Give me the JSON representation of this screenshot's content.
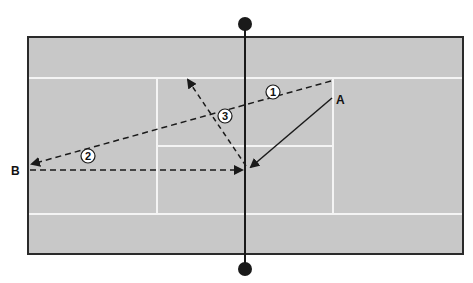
{
  "diagram": {
    "type": "tennis-court-tactic",
    "colors": {
      "background": "#ffffff",
      "court": "#c8c8c8",
      "court_lines": "#f4f4f4",
      "border": "#2a2a2a",
      "net": "#1a1a1a",
      "arrows": "#1a1a1a"
    },
    "players": [
      {
        "id": "A",
        "label": "A"
      },
      {
        "id": "B",
        "label": "B"
      }
    ],
    "shots": [
      {
        "number": "1",
        "label": "1",
        "style": "dashed",
        "description": "from A corner to B"
      },
      {
        "number": "2",
        "label": "2",
        "style": "dashed",
        "description": "from B to net"
      },
      {
        "number": "3",
        "label": "3",
        "style": "dashed",
        "description": "from net toward service box corner"
      }
    ],
    "movement": {
      "from": "A",
      "to": "net",
      "style": "solid"
    }
  }
}
